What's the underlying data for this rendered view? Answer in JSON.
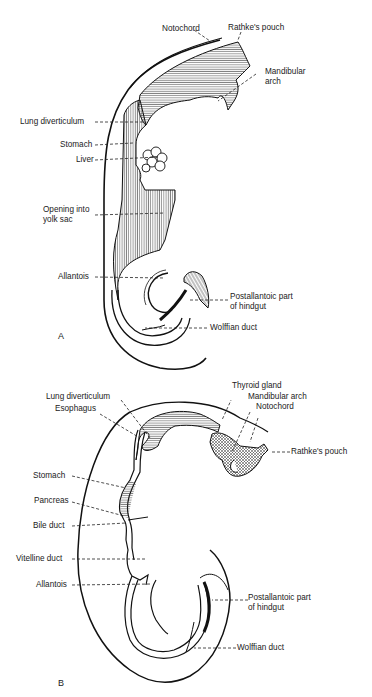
{
  "figure_a": {
    "panel_label": "A",
    "labels": {
      "notochord": "Notochord",
      "rathkes_pouch": "Rathke's pouch",
      "mandibular_arch_1": "Mandibular",
      "mandibular_arch_2": "arch",
      "lung_diverticulum": "Lung diverticulum",
      "stomach": "Stomach",
      "liver": "Liver",
      "opening_yolk_sac_1": "Opening into",
      "opening_yolk_sac_2": "yolk sac",
      "allantois": "Allantois",
      "postallantoic_1": "Postallantoic part",
      "postallantoic_2": "of hindgut",
      "wolffian_duct": "Wolffian duct"
    }
  },
  "figure_b": {
    "panel_label": "B",
    "labels": {
      "lung_diverticulum": "Lung diverticulum",
      "thyroid_gland": "Thyroid gland",
      "mandibular_arch": "Mandibular arch",
      "notochord": "Notochord",
      "esophagus": "Esophagus",
      "rathkes_pouch": "Rathke's pouch",
      "stomach": "Stomach",
      "pancreas": "Pancreas",
      "bile_duct": "Bile duct",
      "vitelline_duct": "Vitelline duct",
      "allantois": "Allantois",
      "postallantoic_1": "Postallantoic part",
      "postallantoic_2": "of hindgut",
      "wolffian_duct": "Wolffian duct"
    }
  }
}
